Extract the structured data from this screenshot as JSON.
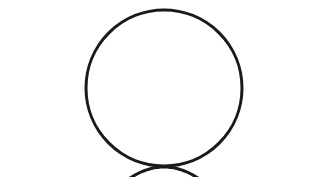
{
  "figure": {
    "kind": "geometric-line-drawing",
    "canvas": {
      "width": 326,
      "height": 177,
      "background_color": "#ffffff"
    },
    "stroke": {
      "color": "#1a1a1a",
      "width": 3.0,
      "linecap": "round"
    },
    "shapes": [
      {
        "name": "circle",
        "type": "circle",
        "center_x": 164,
        "center_y": 88,
        "radius": 78
      },
      {
        "name": "parabola",
        "type": "parabola",
        "vertex_x": 164,
        "vertex_y": 167,
        "opens": "up",
        "coefficient_a": 0.00955,
        "x_start": 11,
        "x_end": 317,
        "y_start": 13,
        "y_end": 13
      }
    ]
  },
  "chart_data": {
    "type": "line",
    "title": "",
    "subtitle": "",
    "xlabel": "",
    "ylabel": "",
    "grid": false,
    "legend": null,
    "legend_position": "none",
    "axis_visible": false,
    "tick_labels_x": [],
    "tick_labels_y": [],
    "xlim": [
      0,
      326
    ],
    "ylim": [
      0,
      177
    ],
    "annotations": [],
    "series": [
      {
        "name": "parabola",
        "color": "#1a1a1a",
        "equation": "y = 0.00955 * (x - 164)^2 + 167",
        "x": [
          11,
          34,
          57,
          80,
          103,
          126,
          149,
          164,
          179,
          202,
          225,
          248,
          271,
          294,
          317
        ],
        "y": [
          390.6,
          321.9,
          265.0,
          219.8,
          186.4,
          164.8,
          154.9,
          152.0,
          154.9,
          164.8,
          186.4,
          219.8,
          265.0,
          321.9,
          390.6
        ]
      },
      {
        "name": "circle",
        "color": "#1a1a1a",
        "equation": "(x - 164)^2 + (y - 88)^2 = 78^2",
        "center": [
          164,
          88
        ],
        "radius": 78
      }
    ]
  }
}
